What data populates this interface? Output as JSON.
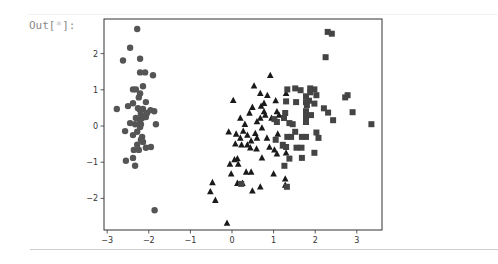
{
  "cell": {
    "prompt_prefix": "Out[",
    "prompt_star": "*",
    "prompt_suffix": "]:"
  },
  "colors": {
    "circle": "#555555",
    "triangle": "#1a1a1a",
    "square": "#444444",
    "axis": "#333333"
  },
  "chart_data": {
    "type": "scatter",
    "title": "",
    "xlabel": "",
    "ylabel": "",
    "xlim": [
      -3.1,
      3.6
    ],
    "ylim": [
      -2.85,
      2.9
    ],
    "xticks": [
      -3,
      -2,
      -1,
      0,
      1,
      2,
      3
    ],
    "yticks": [
      -2,
      -1,
      0,
      1,
      2
    ],
    "xtick_labels": [
      "−3",
      "−2",
      "−1",
      "0",
      "1",
      "2",
      "3"
    ],
    "ytick_labels": [
      "2",
      "1",
      "0",
      "−1",
      "−2"
    ],
    "grid": false,
    "legend": null,
    "series": [
      {
        "name": "cluster-circle",
        "marker": "circle",
        "points": [
          [
            -2.28,
            2.68
          ],
          [
            -2.45,
            2.16
          ],
          [
            -2.62,
            1.81
          ],
          [
            -2.21,
            1.86
          ],
          [
            -2.21,
            1.48
          ],
          [
            -2.09,
            1.48
          ],
          [
            -1.9,
            1.4
          ],
          [
            -2.38,
            1.01
          ],
          [
            -2.31,
            1.01
          ],
          [
            -2.14,
            1.1
          ],
          [
            -2.21,
            0.9
          ],
          [
            -2.24,
            0.79
          ],
          [
            -2.77,
            0.47
          ],
          [
            -2.5,
            0.55
          ],
          [
            -2.38,
            0.63
          ],
          [
            -2.07,
            0.66
          ],
          [
            -2.26,
            0.49
          ],
          [
            -2.14,
            0.47
          ],
          [
            -2.21,
            0.44
          ],
          [
            -1.87,
            0.41
          ],
          [
            -1.96,
            0.44
          ],
          [
            -2.04,
            0.36
          ],
          [
            -2.19,
            0.33
          ],
          [
            -2.31,
            0.22
          ],
          [
            -2.16,
            0.22
          ],
          [
            -2.21,
            0.16
          ],
          [
            -2.07,
            0.25
          ],
          [
            -2.45,
            0.08
          ],
          [
            -2.19,
            0.05
          ],
          [
            -2.33,
            0.05
          ],
          [
            -1.83,
            0.05
          ],
          [
            -2.21,
            -0.03
          ],
          [
            -2.57,
            -0.14
          ],
          [
            -2.28,
            -0.16
          ],
          [
            -2.38,
            -0.25
          ],
          [
            -2.16,
            -0.3
          ],
          [
            -2.19,
            -0.38
          ],
          [
            -2.14,
            -0.44
          ],
          [
            -2.28,
            -0.52
          ],
          [
            -2.24,
            -0.66
          ],
          [
            -2.36,
            -0.66
          ],
          [
            -2.07,
            -0.6
          ],
          [
            -1.95,
            -0.58
          ],
          [
            -2.55,
            -0.96
          ],
          [
            -2.38,
            -0.88
          ],
          [
            -2.33,
            -1.1
          ],
          [
            -1.86,
            -2.33
          ]
        ]
      },
      {
        "name": "cluster-triangle",
        "marker": "triangle",
        "points": [
          [
            0.92,
            1.4
          ],
          [
            1.3,
            0.9
          ],
          [
            0.53,
            1.11
          ],
          [
            0.68,
            0.9
          ],
          [
            0.85,
            0.85
          ],
          [
            1.05,
            0.7
          ],
          [
            0.77,
            0.63
          ],
          [
            1.08,
            0.4
          ],
          [
            1.13,
            0.3
          ],
          [
            0.7,
            0.55
          ],
          [
            0.77,
            0.4
          ],
          [
            0.68,
            0.22
          ],
          [
            0.95,
            0.22
          ],
          [
            0.8,
            0.3
          ],
          [
            0.03,
            0.71
          ],
          [
            0.49,
            0.52
          ],
          [
            0.42,
            0.36
          ],
          [
            0.6,
            0.12
          ],
          [
            0.72,
            -0.05
          ],
          [
            0.27,
            -0.14
          ],
          [
            0.1,
            -0.22
          ],
          [
            0.37,
            -0.25
          ],
          [
            0.2,
            -0.33
          ],
          [
            0.56,
            -0.2
          ],
          [
            0.84,
            -0.33
          ],
          [
            1.1,
            -0.22
          ],
          [
            0.31,
            0.05
          ],
          [
            0.2,
            0.22
          ],
          [
            -0.08,
            -0.16
          ],
          [
            0.08,
            -0.49
          ],
          [
            0.23,
            -0.52
          ],
          [
            0.46,
            -0.41
          ],
          [
            0.37,
            -0.52
          ],
          [
            0.44,
            -0.6
          ],
          [
            0.59,
            -0.63
          ],
          [
            0.72,
            -0.88
          ],
          [
            0.06,
            -0.93
          ],
          [
            0.13,
            -0.9
          ],
          [
            -0.05,
            -1.05
          ],
          [
            -0.02,
            -1.32
          ],
          [
            0.34,
            -1.27
          ],
          [
            0.46,
            -1.27
          ],
          [
            0.9,
            -0.58
          ],
          [
            1.02,
            -0.66
          ],
          [
            1.08,
            -0.77
          ],
          [
            0.13,
            -1.58
          ],
          [
            0.25,
            -1.58
          ],
          [
            0.68,
            -1.68
          ],
          [
            0.49,
            -1.79
          ],
          [
            1.22,
            -0.55
          ],
          [
            1.3,
            -0.74
          ],
          [
            1.0,
            -1.32
          ],
          [
            1.28,
            -1.46
          ],
          [
            1.28,
            -1.63
          ],
          [
            -0.47,
            -1.56
          ],
          [
            -0.52,
            -1.81
          ],
          [
            -0.4,
            -2.05
          ],
          [
            -0.12,
            -2.68
          ],
          [
            0.6,
            -0.33
          ],
          [
            0.15,
            -1.05
          ]
        ]
      },
      {
        "name": "cluster-square",
        "marker": "square",
        "points": [
          [
            2.3,
            2.6
          ],
          [
            2.4,
            2.55
          ],
          [
            2.25,
            1.9
          ],
          [
            1.33,
            1.01
          ],
          [
            1.52,
            1.04
          ],
          [
            1.65,
            0.99
          ],
          [
            1.88,
            1.04
          ],
          [
            1.98,
            1.01
          ],
          [
            1.88,
            0.93
          ],
          [
            2.03,
            0.85
          ],
          [
            1.78,
            0.82
          ],
          [
            2.78,
            0.85
          ],
          [
            2.72,
            0.79
          ],
          [
            1.3,
            0.68
          ],
          [
            1.54,
            0.66
          ],
          [
            1.78,
            0.66
          ],
          [
            1.85,
            0.7
          ],
          [
            1.98,
            0.62
          ],
          [
            1.8,
            0.58
          ],
          [
            2.21,
            0.49
          ],
          [
            2.31,
            0.37
          ],
          [
            2.9,
            0.38
          ],
          [
            2.43,
            0.16
          ],
          [
            3.35,
            0.05
          ],
          [
            1.78,
            0.41
          ],
          [
            1.9,
            0.3
          ],
          [
            1.78,
            0.25
          ],
          [
            1.78,
            0.11
          ],
          [
            1.28,
            0.36
          ],
          [
            1.25,
            0.22
          ],
          [
            1.38,
            0.08
          ],
          [
            1.46,
            0.05
          ],
          [
            1.02,
            0.19
          ],
          [
            1.08,
            0.11
          ],
          [
            1.52,
            -0.16
          ],
          [
            1.68,
            -0.3
          ],
          [
            1.78,
            -0.3
          ],
          [
            1.33,
            -0.3
          ],
          [
            1.42,
            -0.3
          ],
          [
            2.08,
            -0.33
          ],
          [
            1.05,
            -0.38
          ],
          [
            1.22,
            -0.52
          ],
          [
            1.3,
            -0.58
          ],
          [
            1.55,
            -0.6
          ],
          [
            1.67,
            -0.6
          ],
          [
            1.38,
            -0.9
          ],
          [
            1.98,
            -0.74
          ],
          [
            1.26,
            -1.1
          ],
          [
            1.68,
            -0.88
          ],
          [
            0.22,
            -1.6
          ],
          [
            1.32,
            -1.68
          ],
          [
            2.03,
            -0.18
          ]
        ]
      }
    ]
  }
}
